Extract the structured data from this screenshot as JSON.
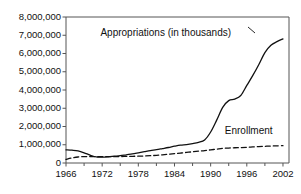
{
  "chart_data": {
    "type": "line",
    "title": "",
    "xlabel": "",
    "ylabel": "",
    "xlim": [
      1966,
      2003
    ],
    "ylim": [
      0,
      8000000
    ],
    "grid": false,
    "legend_position": "inline-annotations",
    "x_ticks": [
      1966,
      1972,
      1978,
      1984,
      1990,
      1996,
      2002
    ],
    "x_minor_ticks": [
      1969,
      1975,
      1981,
      1987,
      1993,
      1999
    ],
    "y_ticks": [
      0,
      1000000,
      2000000,
      3000000,
      4000000,
      5000000,
      6000000,
      7000000,
      8000000
    ],
    "y_tick_labels": [
      "0",
      "1,000,000",
      "2,000,000",
      "3,000,000",
      "4,000,000",
      "5,000,000",
      "6,000,000",
      "7,000,000",
      "8,000,000"
    ],
    "annotations": [
      {
        "name": "appropriations-label",
        "text": "Appropriations (in thousands)",
        "x": 1982,
        "y": 7150000
      },
      {
        "name": "enrollment-label",
        "text": "Enrollment",
        "x": 1996,
        "y": 1750000
      }
    ],
    "series": [
      {
        "name": "Appropriations (in thousands)",
        "style": "solid",
        "color": "#111111",
        "x": [
          1966,
          1967,
          1968,
          1969,
          1970,
          1971,
          1972,
          1973,
          1974,
          1975,
          1976,
          1977,
          1978,
          1979,
          1980,
          1981,
          1982,
          1983,
          1984,
          1985,
          1986,
          1987,
          1988,
          1989,
          1990,
          1991,
          1992,
          1993,
          1994,
          1995,
          1996,
          1997,
          1998,
          1999,
          2000,
          2001,
          2002
        ],
        "values": [
          720000,
          700000,
          660000,
          560000,
          430000,
          330000,
          320000,
          340000,
          370000,
          400000,
          450000,
          500000,
          560000,
          620000,
          680000,
          730000,
          790000,
          850000,
          920000,
          980000,
          1010000,
          1060000,
          1130000,
          1260000,
          1700000,
          2350000,
          3050000,
          3420000,
          3500000,
          3700000,
          4250000,
          4800000,
          5400000,
          6050000,
          6450000,
          6650000,
          6800000
        ]
      },
      {
        "name": "Enrollment",
        "style": "dashed",
        "color": "#111111",
        "x": [
          1966,
          1967,
          1968,
          1969,
          1970,
          1971,
          1972,
          1973,
          1974,
          1975,
          1976,
          1977,
          1978,
          1979,
          1980,
          1981,
          1982,
          1983,
          1984,
          1985,
          1986,
          1987,
          1988,
          1989,
          1990,
          1991,
          1992,
          1993,
          1994,
          1995,
          1996,
          1997,
          1998,
          1999,
          2000,
          2001,
          2002
        ],
        "values": [
          200000,
          280000,
          330000,
          350000,
          355000,
          350000,
          345000,
          345000,
          350000,
          355000,
          360000,
          365000,
          375000,
          385000,
          400000,
          420000,
          450000,
          480000,
          510000,
          545000,
          580000,
          615000,
          650000,
          680000,
          720000,
          760000,
          800000,
          820000,
          835000,
          845000,
          860000,
          880000,
          900000,
          915000,
          930000,
          940000,
          950000
        ]
      }
    ]
  }
}
